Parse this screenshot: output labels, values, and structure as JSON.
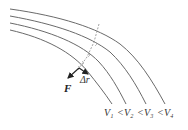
{
  "diagram": {
    "type": "equipotential-lines",
    "labels": {
      "force": "F",
      "displacement": "Δr",
      "potential_order": [
        "V₁",
        "<",
        "V₂",
        "<",
        "V₃",
        "<",
        "V₄"
      ]
    },
    "colors": {
      "lines": "#6a6a6a",
      "vectors": "#222222",
      "text": "#333333"
    },
    "equipotentials": [
      {
        "name": "V1",
        "label": "V₁"
      },
      {
        "name": "V2",
        "label": "V₂"
      },
      {
        "name": "V3",
        "label": "V₃"
      },
      {
        "name": "V4",
        "label": "V₄"
      }
    ]
  }
}
